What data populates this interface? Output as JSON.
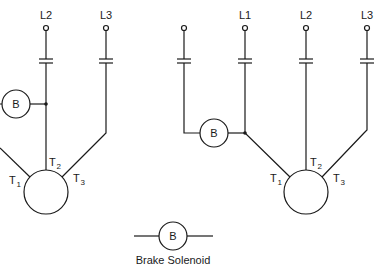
{
  "left_circuit": {
    "lines": [
      {
        "label": "L2",
        "x": 46
      },
      {
        "label": "L3",
        "x": 106
      }
    ],
    "solenoid_label": "B",
    "motor_terminals": [
      "T1",
      "T2",
      "T3"
    ]
  },
  "right_circuit": {
    "lines": [
      {
        "label": "",
        "x": 184
      },
      {
        "label": "L1",
        "x": 245
      },
      {
        "label": "L2",
        "x": 306
      },
      {
        "label": "L3",
        "x": 367
      }
    ],
    "solenoid_label": "B",
    "motor_terminals": [
      "T1",
      "T2",
      "T3"
    ]
  },
  "legend": {
    "symbol_label": "B",
    "caption": "Brake Solenoid"
  },
  "terminal_labels": {
    "t": "T",
    "sub1": "1",
    "sub2": "2",
    "sub3": "3"
  },
  "colors": {
    "stroke": "#1a1a1a",
    "background": "#ffffff"
  }
}
